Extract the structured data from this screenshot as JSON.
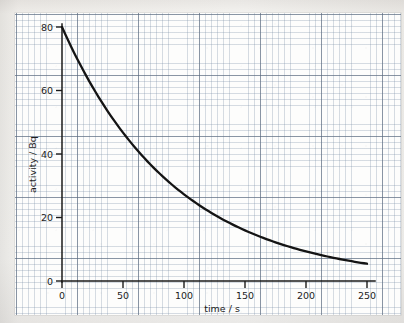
{
  "chart_data": {
    "type": "line",
    "title": "",
    "subtitle": "",
    "xlabel": "time / s",
    "ylabel": "activity / Bq",
    "xlim": [
      0,
      260
    ],
    "ylim": [
      0,
      84
    ],
    "x_ticks": [
      0,
      50,
      100,
      150,
      200,
      250
    ],
    "y_ticks": [
      0,
      20,
      40,
      60,
      80
    ],
    "x_tick_labels": [
      "0",
      "50",
      "100",
      "150",
      "200",
      "250"
    ],
    "y_tick_labels": [
      "0",
      "20",
      "40",
      "60",
      "80"
    ],
    "grid": true,
    "grid_style": "graph-paper, minor squares with major line every 5",
    "legend": false,
    "legend_position": "none",
    "annotations": [],
    "series": [
      {
        "name": "activity",
        "description": "exponential radioactive decay, A = 80 * exp(-t / 140), half-life about 97 s",
        "x": [
          0,
          10,
          20,
          30,
          40,
          50,
          60,
          70,
          80,
          90,
          100,
          110,
          120,
          130,
          140,
          150,
          160,
          170,
          180,
          190,
          200,
          210,
          220,
          230,
          240,
          250
        ],
        "values": [
          80.0,
          74.5,
          69.3,
          64.5,
          60.1,
          55.9,
          52.1,
          48.5,
          45.1,
          42.0,
          39.1,
          36.4,
          33.9,
          31.5,
          29.4,
          27.3,
          25.4,
          23.7,
          22.0,
          20.5,
          19.1,
          17.8,
          16.6,
          15.4,
          14.4,
          13.4
        ]
      }
    ],
    "readings": [
      {
        "x": 0,
        "y": 80
      },
      {
        "x": 50,
        "y": 36.5
      },
      {
        "x": 100,
        "y": 20.5
      },
      {
        "x": 150,
        "y": 12
      },
      {
        "x": 200,
        "y": 6
      },
      {
        "x": 250,
        "y": 2.5
      }
    ],
    "curve_model": {
      "A0": 80,
      "tau": 93,
      "formula": "A = 80 * exp(-t / 93)"
    },
    "colors": {
      "curve": "#141414",
      "axis": "#1a1a1a",
      "grid_minor": "#7b8ca5",
      "grid_major": "#5a697d",
      "paper": "#fdfdfc",
      "background": "#f3f2f0",
      "text": "#1c1c1c"
    }
  }
}
